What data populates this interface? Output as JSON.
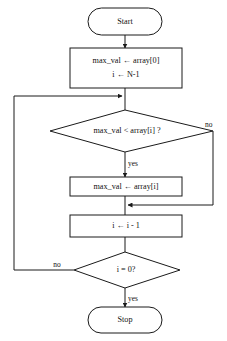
{
  "diagram": {
    "type": "flowchart",
    "background_color": "#ffffff",
    "line_color": "#1a1a1a",
    "text_color": "#111111",
    "nodes": [
      {
        "id": "start",
        "shape": "terminator",
        "label": "Start"
      },
      {
        "id": "init",
        "shape": "process",
        "label_line1": "max_val ← array[0]",
        "label_line2": "i ← N-1"
      },
      {
        "id": "compare",
        "shape": "decision",
        "label": "max_val < array[i] ?"
      },
      {
        "id": "assign",
        "shape": "process",
        "label": "max_val ← array[i]"
      },
      {
        "id": "decrement",
        "shape": "process",
        "label": "i ← i - 1"
      },
      {
        "id": "testzero",
        "shape": "decision",
        "label": "i = 0?"
      },
      {
        "id": "stop",
        "shape": "terminator",
        "label": "Stop"
      }
    ],
    "edge_labels": {
      "compare_no": "no",
      "compare_yes": "yes",
      "testzero_no": "no",
      "testzero_yes": "yes"
    }
  }
}
